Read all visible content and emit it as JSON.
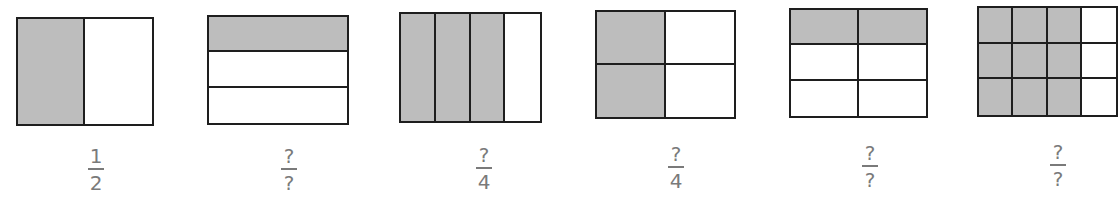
{
  "colors": {
    "shaded": "#bdbdbd",
    "outline": "#1e1e1e",
    "label": "#7a7a7a"
  },
  "figures": [
    {
      "id": 1,
      "rows": 1,
      "cols": 2,
      "shaded": [
        [
          0,
          0
        ]
      ],
      "box": [
        16,
        17,
        138,
        109
      ],
      "label": {
        "numerator": "1",
        "denominator": "2"
      },
      "label_x": 96,
      "label_y": 146
    },
    {
      "id": 2,
      "rows": 3,
      "cols": 1,
      "shaded": [
        [
          0,
          0
        ]
      ],
      "box": [
        207,
        15,
        142,
        110
      ],
      "label": {
        "numerator": "?",
        "denominator": "?"
      },
      "label_x": 289,
      "label_y": 146
    },
    {
      "id": 3,
      "rows": 1,
      "cols": 4,
      "shaded": [
        [
          0,
          0
        ],
        [
          0,
          1
        ],
        [
          0,
          2
        ]
      ],
      "box": [
        399,
        12,
        143,
        111
      ],
      "label": {
        "numerator": "?",
        "denominator": "4"
      },
      "label_x": 484,
      "label_y": 145
    },
    {
      "id": 4,
      "rows": 2,
      "cols": 2,
      "shaded": [
        [
          0,
          0
        ],
        [
          1,
          0
        ]
      ],
      "box": [
        595,
        10,
        141,
        109
      ],
      "label": {
        "numerator": "?",
        "denominator": "4"
      },
      "label_x": 676,
      "label_y": 144
    },
    {
      "id": 5,
      "rows": 3,
      "cols": 2,
      "shaded": [
        [
          0,
          0
        ],
        [
          0,
          1
        ]
      ],
      "box": [
        789,
        8,
        139,
        110
      ],
      "label": {
        "numerator": "?",
        "denominator": "?"
      },
      "label_x": 870,
      "label_y": 143
    },
    {
      "id": 6,
      "rows": 3,
      "cols": 4,
      "shaded": [
        [
          0,
          0
        ],
        [
          0,
          1
        ],
        [
          0,
          2
        ],
        [
          1,
          0
        ],
        [
          1,
          1
        ],
        [
          1,
          2
        ],
        [
          2,
          0
        ],
        [
          2,
          1
        ],
        [
          2,
          2
        ]
      ],
      "box": [
        977,
        6,
        141,
        111
      ],
      "label": {
        "numerator": "?",
        "denominator": "?"
      },
      "label_x": 1058,
      "label_y": 142
    }
  ]
}
